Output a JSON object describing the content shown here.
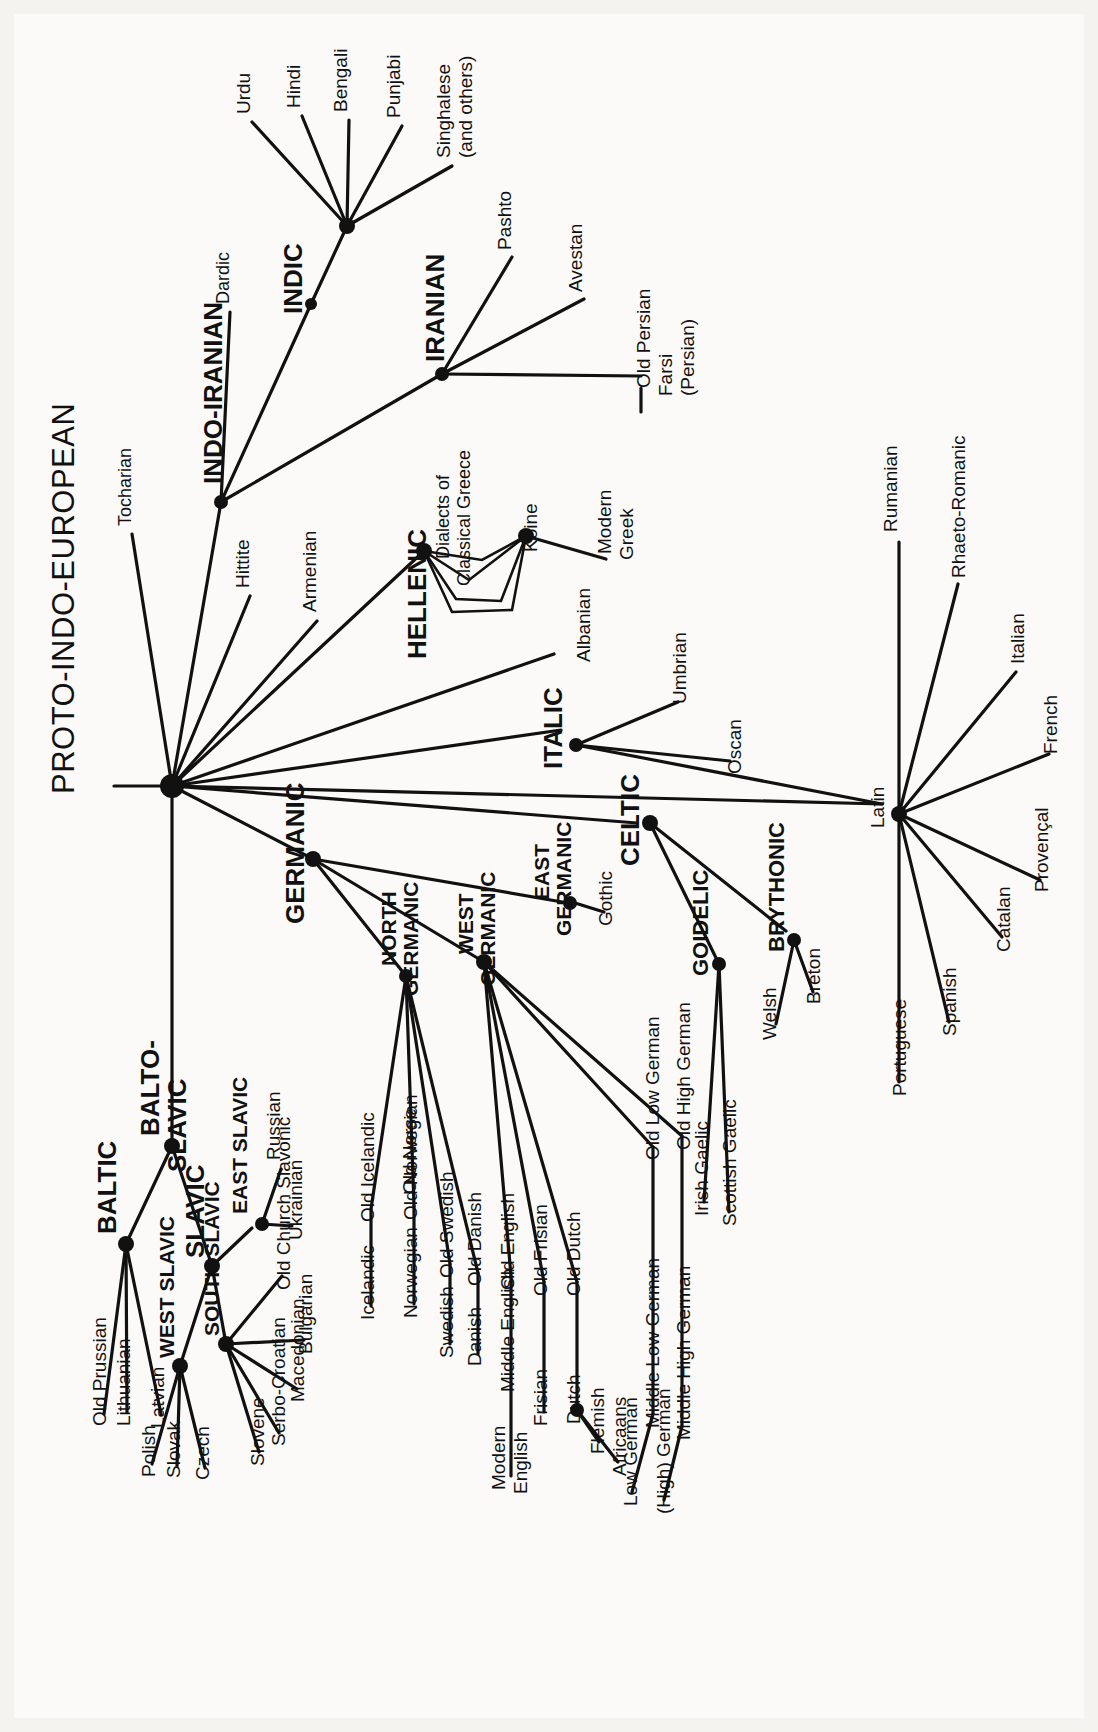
{
  "title": "PROTO-INDO-EUROPEAN",
  "diagram": {
    "type": "language-family-tree",
    "orientation": "rotated-90-counterclockwise",
    "root": "PROTO-INDO-EUROPEAN"
  },
  "labels": {
    "root": "PROTO-INDO-EUROPEAN",
    "tocharian": "Tocharian",
    "indo_iranian": "INDO-IRANIAN",
    "dardic": "Dardic",
    "indic": "INDIC",
    "sanskrit": "Sanscrit",
    "urdu": "Urdu",
    "hindi": "Hindi",
    "bengali": "Bengali",
    "punjabi": "Punjabi",
    "singhalese": "Singhalese",
    "singhalese_2": "(and others)",
    "iranian": "IRANIAN",
    "pashto": "Pashto",
    "avestan": "Avestan",
    "old_persian": "Old Persian",
    "farsi": "Farsi",
    "farsi_2": "(Persian)",
    "hittite": "Hittite",
    "armenian": "Armenian",
    "hellenic": "HELLENIC",
    "dialects_1": "Dialects of",
    "dialects_2": "Classical Greece",
    "koine": "Koine",
    "modern_greek_1": "Modern",
    "modern_greek_2": "Greek",
    "albanian": "Albanian",
    "italic": "ITALIC",
    "umbrian": "Umbrian",
    "oscan": "Oscan",
    "latin": "Latin",
    "rumanian": "Rumanian",
    "rhaeto": "Rhaeto-Romanic",
    "italian": "Italian",
    "french": "French",
    "provencal": "Provençal",
    "catalan": "Catalan",
    "spanish": "Spanish",
    "portuguese": "Portuguese",
    "celtic": "CELTIC",
    "goidelic": "GOIDELIC",
    "irish_gaelic": "Irish Gaelic",
    "scottish_gaelic": "Scottish Gaelic",
    "brythonic": "BRYTHONIC",
    "welsh": "Welsh",
    "breton": "Breton",
    "germanic": "GERMANIC",
    "north_germanic_1": "NORTH",
    "north_germanic_2": "GERMANIC",
    "old_norse": "Old Norse",
    "old_icelandic": "Old Icelandic",
    "icelandic": "Icelandic",
    "old_norwegian": "Old Norwegian",
    "norwegian": "Norwegian",
    "old_swedish": "Old Swedish",
    "swedish": "Swedish",
    "old_danish": "Old Danish",
    "danish": "Danish",
    "west_germanic_1": "WEST",
    "west_germanic_2": "GERMANIC",
    "old_english": "Old English",
    "middle_english": "Middle English",
    "modern_english_1": "Modern",
    "modern_english_2": "English",
    "old_frisian": "Old Frisian",
    "frisian": "Frisian",
    "old_dutch": "Old Dutch",
    "dutch": "Dutch",
    "flemish": "Flemish",
    "africaans": "Africaans",
    "old_low_german": "Old Low German",
    "middle_low_german": "Middle Low German",
    "low_german": "Low German",
    "old_high_german": "Old High German",
    "middle_high_german": "Middle High German",
    "high_german": "(High) German",
    "east_germanic_1": "EAST",
    "east_germanic_2": "GERMANIC",
    "gothic": "Gothic",
    "balto_slavic_1": "BALTO-",
    "balto_slavic_2": "SLAVIC",
    "baltic": "BALTIC",
    "old_prussian": "Old Prussian",
    "lithuanian": "Lithuanian",
    "latvian": "Latvian",
    "slavic": "SLAVIC",
    "east_slavic": "EAST SLAVIC",
    "russian": "Russian",
    "ukrainian": "Ukrainian",
    "west_slavic": "WEST SLAVIC",
    "polish": "Polish",
    "slovak": "Slovak",
    "czech": "Czech",
    "south_slavic": "SOUTH SLAVIC",
    "old_church_slavonic": "Old Church Slavonic",
    "bulgarian": "Bulgarian",
    "macedonian": "Macedonian",
    "serbo_croatian": "Serbo-Croatian",
    "slovene": "Slovene"
  },
  "colors": {
    "ink": "#111111",
    "paper": "#fbfaf8",
    "page": "#f4f3f0"
  }
}
